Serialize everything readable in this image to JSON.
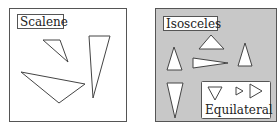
{
  "colors": {
    "background": "#ffffff",
    "panel_border": "#555555",
    "isosceles_fill": "#c8c8c8",
    "shape_stroke": "#444444",
    "shape_fill_white": "#ffffff",
    "label_fill": "#ffffff"
  },
  "panels": {
    "scalene": {
      "label": "Scalene",
      "triangles": [
        {
          "name": "small-scalene",
          "points": "43,40 60,40 68,62"
        },
        {
          "name": "tall-scalene",
          "points": "89,36 110,36 93,98"
        },
        {
          "name": "wide-scalene",
          "points": "21,72 85,84 59,103"
        }
      ]
    },
    "isosceles": {
      "label": "Isosceles",
      "triangles": [
        {
          "name": "top-isosceles",
          "points": "211,35 199,49 224,49"
        },
        {
          "name": "left-up-isosceles",
          "points": "174,47 167,70 182,70"
        },
        {
          "name": "horizontal-isosceles",
          "points": "193,58 193,68 228,63"
        },
        {
          "name": "right-up-isosceles",
          "points": "245,43 238,66 252,66"
        },
        {
          "name": "down-isosceles",
          "points": "167,83 183,83 175,118"
        }
      ],
      "equilateral": {
        "label": "Equilateral",
        "triangles": [
          {
            "name": "down-equilateral",
            "points": "208,87 222,87 215,100"
          },
          {
            "name": "small-right-equilateral",
            "points": "236,87 236,95 243,91"
          },
          {
            "name": "large-right-equilateral",
            "points": "250,84 250,98 262,91"
          }
        ]
      }
    }
  }
}
